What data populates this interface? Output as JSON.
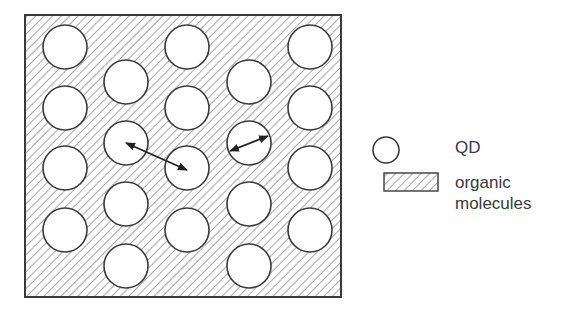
{
  "figure": {
    "frame": {
      "x": 25,
      "y": 15,
      "width": 316,
      "height": 282
    },
    "hatch_color": "#777777",
    "stroke_color": "#3a3a3a",
    "particle_radius": 22,
    "particles": [
      {
        "cx": 65,
        "cy": 47
      },
      {
        "cx": 65,
        "cy": 108
      },
      {
        "cx": 65,
        "cy": 168
      },
      {
        "cx": 65,
        "cy": 230
      },
      {
        "cx": 126,
        "cy": 82
      },
      {
        "cx": 126,
        "cy": 143
      },
      {
        "cx": 126,
        "cy": 204
      },
      {
        "cx": 126,
        "cy": 266
      },
      {
        "cx": 187,
        "cy": 47
      },
      {
        "cx": 187,
        "cy": 108
      },
      {
        "cx": 187,
        "cy": 168
      },
      {
        "cx": 187,
        "cy": 230
      },
      {
        "cx": 249,
        "cy": 82
      },
      {
        "cx": 249,
        "cy": 143
      },
      {
        "cx": 249,
        "cy": 204
      },
      {
        "cx": 249,
        "cy": 266
      },
      {
        "cx": 310,
        "cy": 47
      },
      {
        "cx": 310,
        "cy": 108
      },
      {
        "cx": 310,
        "cy": 168
      },
      {
        "cx": 310,
        "cy": 230
      }
    ],
    "arrows": [
      {
        "name": "inter-particle-distance-arrow",
        "x1": 126,
        "y1": 143,
        "x2": 187,
        "y2": 170
      },
      {
        "name": "particle-diameter-arrow",
        "x1": 230,
        "y1": 151,
        "x2": 268,
        "y2": 136
      }
    ]
  },
  "legend": {
    "items": [
      {
        "symbol": "circle",
        "label": "QD"
      },
      {
        "symbol": "hatched-rect",
        "label_lines": [
          "organic",
          "molecules"
        ]
      }
    ]
  }
}
